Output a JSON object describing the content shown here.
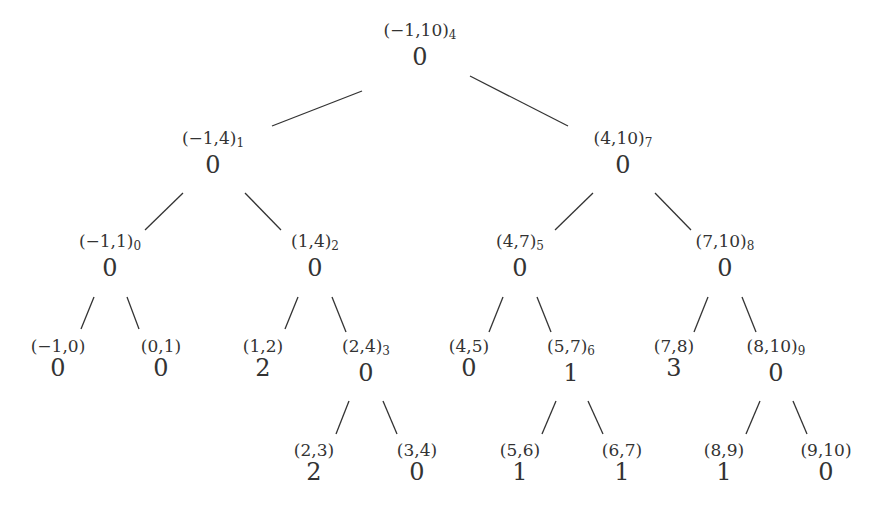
{
  "diagram": {
    "type": "segment-tree",
    "nodes": [
      {
        "id": "n4",
        "label": "(−1,10)",
        "index": "4",
        "value": "0",
        "x": 420,
        "y": 30
      },
      {
        "id": "n1",
        "label": "(−1,4)",
        "index": "1",
        "value": "0",
        "x": 213,
        "y": 138
      },
      {
        "id": "n7",
        "label": "(4,10)",
        "index": "7",
        "value": "0",
        "x": 623,
        "y": 138
      },
      {
        "id": "n0",
        "label": "(−1,1)",
        "index": "0",
        "value": "0",
        "x": 110,
        "y": 241
      },
      {
        "id": "n2",
        "label": "(1,4)",
        "index": "2",
        "value": "0",
        "x": 315,
        "y": 241
      },
      {
        "id": "n5",
        "label": "(4,7)",
        "index": "5",
        "value": "0",
        "x": 520,
        "y": 241
      },
      {
        "id": "n8",
        "label": "(7,10)",
        "index": "8",
        "value": "0",
        "x": 725,
        "y": 241
      },
      {
        "id": "l_m1_0",
        "label": "(−1,0)",
        "index": "",
        "value": "0",
        "x": 58,
        "y": 346
      },
      {
        "id": "l_0_1",
        "label": "(0,1)",
        "index": "",
        "value": "0",
        "x": 161,
        "y": 346
      },
      {
        "id": "l_1_2",
        "label": "(1,2)",
        "index": "",
        "value": "2",
        "x": 263,
        "y": 346
      },
      {
        "id": "n3",
        "label": "(2,4)",
        "index": "3",
        "value": "0",
        "x": 366,
        "y": 346
      },
      {
        "id": "l_4_5",
        "label": "(4,5)",
        "index": "",
        "value": "0",
        "x": 469,
        "y": 346
      },
      {
        "id": "n6",
        "label": "(5,7)",
        "index": "6",
        "value": "1",
        "x": 571,
        "y": 346
      },
      {
        "id": "l_7_8",
        "label": "(7,8)",
        "index": "",
        "value": "3",
        "x": 674,
        "y": 346
      },
      {
        "id": "n9",
        "label": "(8,10)",
        "index": "9",
        "value": "0",
        "x": 776,
        "y": 346
      },
      {
        "id": "l_2_3",
        "label": "(2,3)",
        "index": "",
        "value": "2",
        "x": 314,
        "y": 450
      },
      {
        "id": "l_3_4",
        "label": "(3,4)",
        "index": "",
        "value": "0",
        "x": 417,
        "y": 450
      },
      {
        "id": "l_5_6",
        "label": "(5,6)",
        "index": "",
        "value": "1",
        "x": 520,
        "y": 450
      },
      {
        "id": "l_6_7",
        "label": "(6,7)",
        "index": "",
        "value": "1",
        "x": 622,
        "y": 450
      },
      {
        "id": "l_8_9",
        "label": "(8,9)",
        "index": "",
        "value": "1",
        "x": 724,
        "y": 450
      },
      {
        "id": "l_9_10",
        "label": "(9,10)",
        "index": "",
        "value": "0",
        "x": 826,
        "y": 450
      }
    ],
    "edges": [
      {
        "from": "n4",
        "to": "n1",
        "x1": 362,
        "y1": 91,
        "x2": 272,
        "y2": 126
      },
      {
        "from": "n4",
        "to": "n7",
        "x1": 470,
        "y1": 76,
        "x2": 568,
        "y2": 126
      },
      {
        "from": "n1",
        "to": "n0",
        "x1": 183,
        "y1": 193,
        "x2": 145,
        "y2": 230
      },
      {
        "from": "n1",
        "to": "n2",
        "x1": 245,
        "y1": 193,
        "x2": 281,
        "y2": 230
      },
      {
        "from": "n7",
        "to": "n5",
        "x1": 593,
        "y1": 193,
        "x2": 555,
        "y2": 230
      },
      {
        "from": "n7",
        "to": "n8",
        "x1": 655,
        "y1": 193,
        "x2": 691,
        "y2": 230
      },
      {
        "from": "n0",
        "to": "l_m1_0",
        "x1": 94,
        "y1": 297,
        "x2": 81,
        "y2": 329
      },
      {
        "from": "n0",
        "to": "l_0_1",
        "x1": 127,
        "y1": 297,
        "x2": 139,
        "y2": 329
      },
      {
        "from": "n2",
        "to": "l_1_2",
        "x1": 298,
        "y1": 297,
        "x2": 285,
        "y2": 329
      },
      {
        "from": "n2",
        "to": "n3",
        "x1": 332,
        "y1": 297,
        "x2": 346,
        "y2": 332
      },
      {
        "from": "n5",
        "to": "l_4_5",
        "x1": 503,
        "y1": 297,
        "x2": 489,
        "y2": 332
      },
      {
        "from": "n5",
        "to": "n6",
        "x1": 537,
        "y1": 297,
        "x2": 551,
        "y2": 332
      },
      {
        "from": "n8",
        "to": "l_7_8",
        "x1": 708,
        "y1": 297,
        "x2": 694,
        "y2": 332
      },
      {
        "from": "n8",
        "to": "n9",
        "x1": 742,
        "y1": 297,
        "x2": 756,
        "y2": 332
      },
      {
        "from": "n3",
        "to": "l_2_3",
        "x1": 349,
        "y1": 401,
        "x2": 336,
        "y2": 434
      },
      {
        "from": "n3",
        "to": "l_3_4",
        "x1": 383,
        "y1": 401,
        "x2": 397,
        "y2": 434
      },
      {
        "from": "n6",
        "to": "l_5_6",
        "x1": 556,
        "y1": 401,
        "x2": 542,
        "y2": 434
      },
      {
        "from": "n6",
        "to": "l_6_7",
        "x1": 588,
        "y1": 401,
        "x2": 603,
        "y2": 434
      },
      {
        "from": "n9",
        "to": "l_8_9",
        "x1": 760,
        "y1": 401,
        "x2": 746,
        "y2": 434
      },
      {
        "from": "n9",
        "to": "l_9_10",
        "x1": 793,
        "y1": 401,
        "x2": 807,
        "y2": 434
      }
    ]
  }
}
